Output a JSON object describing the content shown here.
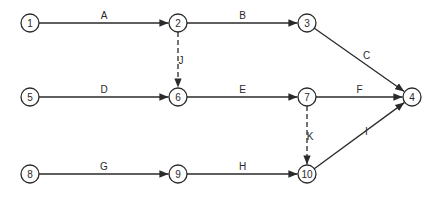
{
  "diagram": {
    "type": "activity-on-arrow network",
    "nodes": [
      {
        "id": "1",
        "label": "1",
        "x": 30,
        "y": 23
      },
      {
        "id": "2",
        "label": "2",
        "x": 178,
        "y": 23
      },
      {
        "id": "3",
        "label": "3",
        "x": 307,
        "y": 23
      },
      {
        "id": "5",
        "label": "5",
        "x": 30,
        "y": 97
      },
      {
        "id": "6",
        "label": "6",
        "x": 178,
        "y": 97
      },
      {
        "id": "7",
        "label": "7",
        "x": 307,
        "y": 97
      },
      {
        "id": "4",
        "label": "4",
        "x": 412,
        "y": 97
      },
      {
        "id": "8",
        "label": "8",
        "x": 30,
        "y": 174
      },
      {
        "id": "9",
        "label": "9",
        "x": 178,
        "y": 174
      },
      {
        "id": "10",
        "label": "10",
        "x": 307,
        "y": 174
      }
    ],
    "edges": [
      {
        "label": "A",
        "from": "1",
        "to": "2",
        "dashed": false
      },
      {
        "label": "B",
        "from": "2",
        "to": "3",
        "dashed": false
      },
      {
        "label": "C",
        "from": "3",
        "to": "4",
        "dashed": false
      },
      {
        "label": "J",
        "from": "2",
        "to": "6",
        "dashed": true
      },
      {
        "label": "D",
        "from": "5",
        "to": "6",
        "dashed": false
      },
      {
        "label": "E",
        "from": "6",
        "to": "7",
        "dashed": false
      },
      {
        "label": "F",
        "from": "7",
        "to": "4",
        "dashed": false
      },
      {
        "label": "K",
        "from": "7",
        "to": "10",
        "dashed": true
      },
      {
        "label": "G",
        "from": "8",
        "to": "9",
        "dashed": false
      },
      {
        "label": "H",
        "from": "9",
        "to": "10",
        "dashed": false
      },
      {
        "label": "I",
        "from": "10",
        "to": "4",
        "dashed": false
      }
    ],
    "colors": {
      "line": "#2a2a2a",
      "background": "#ffffff"
    }
  }
}
